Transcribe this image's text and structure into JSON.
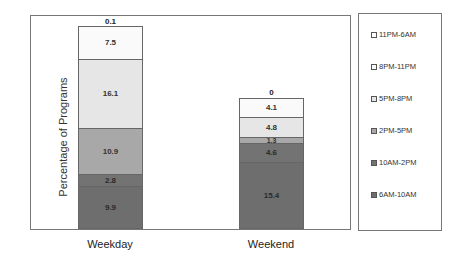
{
  "chart_data": {
    "type": "bar",
    "stacked": true,
    "title": "",
    "xlabel": "",
    "ylabel": "Percentage of Programs",
    "categories": [
      "Weekday",
      "Weekend"
    ],
    "series": [
      {
        "name": "6AM-10AM",
        "values": [
          9.9,
          15.4
        ],
        "color": "#6e6e6e"
      },
      {
        "name": "10AM-2PM",
        "values": [
          2.8,
          4.6
        ],
        "color": "#707070"
      },
      {
        "name": "2PM-5PM",
        "values": [
          10.9,
          1.3
        ],
        "color": "#a8a8a8"
      },
      {
        "name": "5PM-8PM",
        "values": [
          16.1,
          4.8
        ],
        "color": "#e6e6e6"
      },
      {
        "name": "8PM-11PM",
        "values": [
          7.5,
          4.1
        ],
        "color": "#fafafa"
      },
      {
        "name": "11PM-6AM",
        "values": [
          0.1,
          0
        ],
        "color": "#ffffff"
      }
    ],
    "segment_labels": {
      "Weekday": [
        "9.9",
        "2.8",
        "10.9",
        "16.1",
        "7.5",
        "0.1"
      ],
      "Weekend": [
        "15.4",
        "4.6",
        "1.3",
        "4.8",
        "4.1",
        "0"
      ]
    },
    "grid": false,
    "legend_position": "right",
    "legend_order": [
      "11PM-6AM",
      "8PM-11PM",
      "5PM-8PM",
      "2PM-5PM",
      "10AM-2PM",
      "6AM-10AM"
    ]
  },
  "axis": {
    "ylabel": "Percentage of Programs"
  },
  "bars": {
    "weekday": {
      "label": "Weekday",
      "top_label": "0.1",
      "segments": [
        {
          "label": "9.9",
          "value": 9.9,
          "color": "#6e6e6e"
        },
        {
          "label": "2.8",
          "value": 2.8,
          "color": "#737373"
        },
        {
          "label": "10.9",
          "value": 10.9,
          "color": "#a8a8a8"
        },
        {
          "label": "16.1",
          "value": 16.1,
          "color": "#e6e6e6"
        },
        {
          "label": "7.5",
          "value": 7.5,
          "color": "#fafafa"
        }
      ]
    },
    "weekend": {
      "label": "Weekend",
      "top_label": "0",
      "segments": [
        {
          "label": "15.4",
          "value": 15.4,
          "color": "#6e6e6e"
        },
        {
          "label": "4.6",
          "value": 4.6,
          "color": "#737373"
        },
        {
          "label": "1.3",
          "value": 1.3,
          "color": "#a8a8a8"
        },
        {
          "label": "4.8",
          "value": 4.8,
          "color": "#e6e6e6"
        },
        {
          "label": "4.1",
          "value": 4.1,
          "color": "#fafafa"
        }
      ]
    }
  },
  "legend": {
    "items": [
      {
        "label": "11PM-6AM",
        "color": "#ffffff"
      },
      {
        "label": "8PM-11PM",
        "color": "#fafafa"
      },
      {
        "label": "5PM-8PM",
        "color": "#e6e6e6"
      },
      {
        "label": "2PM-5PM",
        "color": "#a8a8a8"
      },
      {
        "label": "10AM-2PM",
        "color": "#737373"
      },
      {
        "label": "6AM-10AM",
        "color": "#6e6e6e"
      }
    ]
  }
}
